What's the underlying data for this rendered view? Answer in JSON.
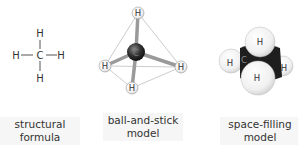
{
  "atoms": {
    "hydrogen": "H",
    "carbon": "C"
  },
  "models": [
    {
      "id": "structural",
      "label_line1": "structural",
      "label_line2": "formula"
    },
    {
      "id": "ball-and-stick",
      "label_line1": "ball-and-stick",
      "label_line2": "model"
    },
    {
      "id": "space-filling",
      "label_line1": "space-filling",
      "label_line2": "model"
    }
  ],
  "colors": {
    "carbon": "#2a2a2a",
    "hydrogen": "#f2f2f2",
    "bond": "#9a9a9a",
    "text": "#333333"
  }
}
